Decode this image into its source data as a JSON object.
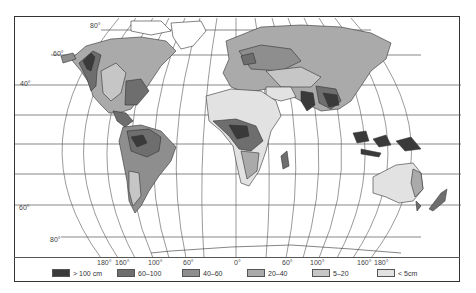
{
  "map": {
    "title": "",
    "projection": "world equal-area (Eckert-style)",
    "variable": "precipitation",
    "latitude_labels": [
      {
        "text": "80°",
        "x": 89,
        "y": 21
      },
      {
        "text": "60°",
        "x": 52,
        "y": 49
      },
      {
        "text": "40°",
        "x": 19,
        "y": 79
      },
      {
        "text": "60°",
        "x": 18,
        "y": 203
      },
      {
        "text": "80°",
        "x": 49,
        "y": 235
      }
    ],
    "longitude_labels": [
      {
        "text": "180°",
        "x": 96
      },
      {
        "text": "160°",
        "x": 114
      },
      {
        "text": "100°",
        "x": 147
      },
      {
        "text": "60°",
        "x": 182
      },
      {
        "text": "0°",
        "x": 233
      },
      {
        "text": "60°",
        "x": 281
      },
      {
        "text": "100°",
        "x": 309
      },
      {
        "text": "160°",
        "x": 356
      },
      {
        "text": "180°",
        "x": 373
      }
    ]
  },
  "legend": {
    "items": [
      {
        "label": "> 100 cm",
        "color": "#3a3a3a",
        "x": 52
      },
      {
        "label": "60–100",
        "color": "#6e6e6e",
        "x": 117
      },
      {
        "label": "40–60",
        "color": "#8e8e8e",
        "x": 182
      },
      {
        "label": "20–40",
        "color": "#aaaaaa",
        "x": 247
      },
      {
        "label": "5–20",
        "color": "#c6c6c6",
        "x": 312
      },
      {
        "label": "< 5cm",
        "color": "#e2e2e2",
        "x": 377
      }
    ]
  }
}
